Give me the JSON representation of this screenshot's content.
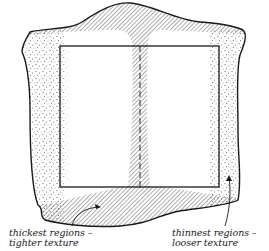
{
  "figure": {
    "colors": {
      "ink": "#1a1a1a",
      "background": "#ffffff",
      "hatch": "#555555",
      "stipple": "#444444"
    }
  },
  "labels": {
    "thickest": {
      "line1": "thickest regions –",
      "line2": "tighter texture"
    },
    "thinnest": {
      "line1": "thinnest regions –",
      "line2": "looser texture"
    }
  },
  "legend_regions": [
    {
      "name": "thickest regions",
      "texture": "tighter texture",
      "pattern": "diagonal hatching",
      "location": "spine and neck/tail band"
    },
    {
      "name": "thinnest regions",
      "texture": "looser texture",
      "pattern": "stippling",
      "location": "flanks / edges"
    }
  ]
}
